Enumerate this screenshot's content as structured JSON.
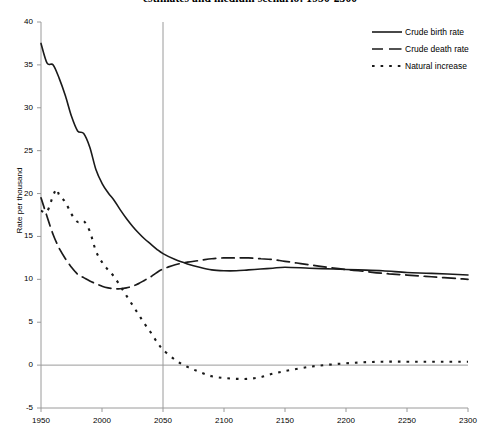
{
  "chart_data": {
    "type": "line",
    "title": "estimates and medium scenario: 1950-2300",
    "xlabel": "",
    "ylabel": "Rate per thousand",
    "xlim": [
      1950,
      2300
    ],
    "ylim": [
      -5,
      40
    ],
    "xticks": [
      "1950",
      "2000",
      "2050",
      "2100",
      "2150",
      "2200",
      "2250",
      "2300"
    ],
    "yticks": [
      "40",
      "35",
      "30",
      "25",
      "20",
      "15",
      "10",
      "5",
      "0",
      "-5"
    ],
    "grid": false,
    "legend_position": "top-right",
    "reference_lines": {
      "vertical_year": 2050,
      "horizontal_value": 0
    },
    "series": [
      {
        "name": "Crude birth rate",
        "style": "solid",
        "color": "#1a1a1a",
        "x": [
          1950,
          1955,
          1960,
          1965,
          1970,
          1975,
          1980,
          1985,
          1990,
          1995,
          2000,
          2005,
          2010,
          2015,
          2020,
          2025,
          2030,
          2035,
          2040,
          2045,
          2050,
          2060,
          2070,
          2080,
          2090,
          2100,
          2110,
          2120,
          2130,
          2140,
          2150,
          2170,
          2190,
          2210,
          2230,
          2250,
          2270,
          2300
        ],
        "values": [
          37.5,
          35.2,
          35.0,
          33.4,
          31.4,
          29.0,
          27.3,
          27.0,
          25.4,
          22.8,
          21.2,
          20.1,
          19.2,
          18.1,
          17.1,
          16.2,
          15.4,
          14.7,
          14.1,
          13.5,
          13.0,
          12.3,
          11.8,
          11.4,
          11.1,
          11.0,
          11.0,
          11.1,
          11.2,
          11.3,
          11.4,
          11.3,
          11.2,
          11.1,
          11.0,
          10.8,
          10.7,
          10.5
        ]
      },
      {
        "name": "Crude death rate",
        "style": "dashed",
        "color": "#1a1a1a",
        "x": [
          1950,
          1955,
          1960,
          1965,
          1970,
          1975,
          1980,
          1985,
          1990,
          1995,
          2000,
          2005,
          2010,
          2015,
          2020,
          2025,
          2030,
          2035,
          2040,
          2045,
          2050,
          2060,
          2070,
          2080,
          2090,
          2100,
          2110,
          2120,
          2130,
          2140,
          2150,
          2170,
          2190,
          2210,
          2230,
          2250,
          2270,
          2300
        ],
        "values": [
          19.5,
          17.3,
          15.2,
          13.6,
          12.4,
          11.4,
          10.6,
          10.2,
          9.8,
          9.5,
          9.2,
          9.0,
          8.9,
          8.9,
          9.0,
          9.2,
          9.5,
          9.9,
          10.3,
          10.8,
          11.2,
          11.7,
          12.0,
          12.2,
          12.4,
          12.5,
          12.5,
          12.5,
          12.4,
          12.3,
          12.1,
          11.7,
          11.3,
          11.0,
          10.7,
          10.5,
          10.3,
          10.0
        ]
      },
      {
        "name": "Natural increase",
        "style": "dotted",
        "color": "#1a1a1a",
        "x": [
          1950,
          1955,
          1960,
          1963,
          1965,
          1970,
          1975,
          1980,
          1985,
          1990,
          1995,
          2000,
          2005,
          2010,
          2015,
          2020,
          2025,
          2030,
          2035,
          2040,
          2045,
          2050,
          2060,
          2070,
          2080,
          2090,
          2100,
          2110,
          2120,
          2130,
          2140,
          2150,
          2170,
          2190,
          2210,
          2230,
          2250,
          2270,
          2300
        ],
        "values": [
          18.0,
          17.9,
          19.8,
          20.5,
          19.8,
          19.0,
          17.6,
          16.7,
          16.8,
          15.6,
          13.3,
          12.0,
          11.1,
          10.3,
          9.2,
          8.1,
          7.0,
          5.9,
          4.8,
          3.8,
          2.7,
          1.8,
          0.6,
          -0.2,
          -0.8,
          -1.3,
          -1.5,
          -1.6,
          -1.6,
          -1.4,
          -1.0,
          -0.7,
          -0.2,
          0.1,
          0.3,
          0.4,
          0.4,
          0.4,
          0.4
        ]
      }
    ]
  },
  "legend": {
    "items": [
      {
        "label": "Crude birth rate",
        "style": "solid"
      },
      {
        "label": "Crude death rate",
        "style": "dashed"
      },
      {
        "label": "Natural increase",
        "style": "dotted"
      }
    ]
  },
  "axes": {
    "y_title": "Rate per thousand",
    "y_labels": [
      "40",
      "35",
      "30",
      "25",
      "20",
      "15",
      "10",
      "5",
      "0",
      "-5"
    ],
    "x_labels": [
      "1950",
      "2000",
      "2050",
      "2100",
      "2150",
      "2200",
      "2250",
      "2300"
    ]
  },
  "colors": {
    "line": "#1a1a1a",
    "axis": "#9a9a9a",
    "background": "#ffffff"
  }
}
